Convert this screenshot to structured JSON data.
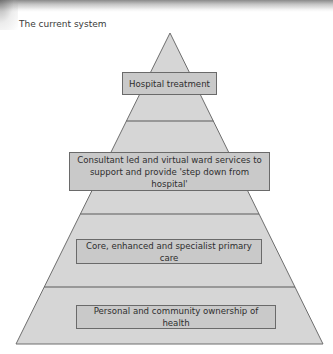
{
  "title": "The current system",
  "colors": {
    "pyramid_fill": "#d6d6d6",
    "pyramid_stroke": "#6e6e6e",
    "box_fill": "#c9c9c9",
    "box_border": "#6a6a6a",
    "text": "#2e2e2e"
  },
  "pyramid": {
    "tiers": [
      {
        "label": "Hospital treatment"
      },
      {
        "label": "Consultant led and virtual ward services to support and provide 'step down from hospital'"
      },
      {
        "label": "Core, enhanced and specialist primary care"
      },
      {
        "label": "Personal and community ownership of health"
      }
    ]
  }
}
